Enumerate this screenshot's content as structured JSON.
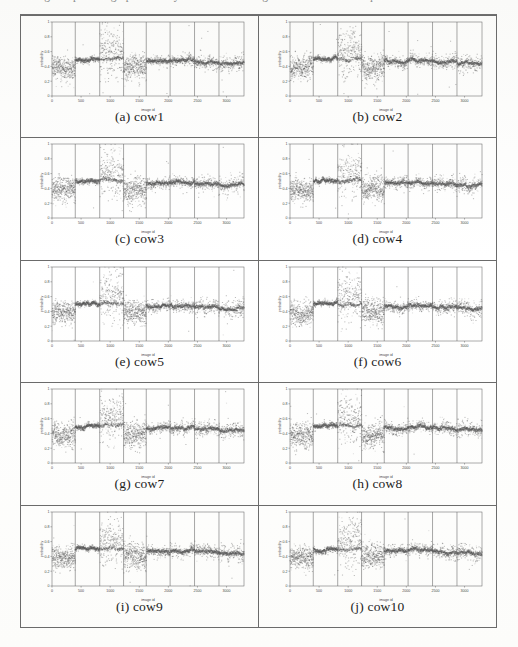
{
  "document": {
    "top_cut_text": "Figure: per-image probability scatter over image id for each cow sequence"
  },
  "figure": {
    "columns": 2,
    "rows": 5,
    "panels": [
      {
        "caption": "(a) cow1",
        "id": "cow1",
        "seed": 11
      },
      {
        "caption": "(b) cow2",
        "id": "cow2",
        "seed": 22
      },
      {
        "caption": "(c) cow3",
        "id": "cow3",
        "seed": 33
      },
      {
        "caption": "(d) cow4",
        "id": "cow4",
        "seed": 44
      },
      {
        "caption": "(e) cow5",
        "id": "cow5",
        "seed": 55
      },
      {
        "caption": "(f) cow6",
        "id": "cow6",
        "seed": 66
      },
      {
        "caption": "(g) cow7",
        "id": "cow7",
        "seed": 77
      },
      {
        "caption": "(h) cow8",
        "id": "cow8",
        "seed": 88
      },
      {
        "caption": "(i) cow9",
        "id": "cow9",
        "seed": 99
      },
      {
        "caption": "(j) cow10",
        "id": "cow10",
        "seed": 110
      }
    ]
  },
  "chart_data": {
    "type": "scatter",
    "title": "",
    "xlabel": "image id",
    "ylabel": "probability",
    "xlim": [
      0,
      3300
    ],
    "ylim": [
      0,
      1
    ],
    "xticks": [
      0,
      500,
      1000,
      1500,
      2000,
      2500,
      3000
    ],
    "xticklabels": [
      "0",
      "500",
      "1000",
      "1500",
      "2000",
      "2500",
      "3000"
    ],
    "yticks": [
      0,
      0.2,
      0.4,
      0.6,
      0.8,
      1
    ],
    "yticklabels": [
      "0",
      "0.2",
      "0.4",
      "0.6",
      "0.8",
      "1"
    ],
    "grid": false,
    "legend": null,
    "marker_color": "#555555",
    "segment_boundaries": [
      400,
      820,
      1230,
      1620,
      2030,
      2450,
      2870
    ],
    "segments": [
      {
        "range": [
          0,
          400
        ],
        "mean": 0.385,
        "spread": 0.075,
        "dense": false,
        "note": "noisy low band"
      },
      {
        "range": [
          400,
          820
        ],
        "mean": 0.5,
        "spread": 0.02,
        "dense": true,
        "note": "tight high band"
      },
      {
        "range": [
          820,
          1230
        ],
        "mean": 0.5,
        "spread": 0.15,
        "dense": true,
        "note": "tight band plus wide upward outlier cloud to 1.0"
      },
      {
        "range": [
          1230,
          1620
        ],
        "mean": 0.39,
        "spread": 0.085,
        "dense": false,
        "note": "noisy low band"
      },
      {
        "range": [
          1620,
          2030
        ],
        "mean": 0.475,
        "spread": 0.04,
        "dense": true,
        "note": "band"
      },
      {
        "range": [
          2030,
          2450
        ],
        "mean": 0.48,
        "spread": 0.04,
        "dense": true,
        "note": "band"
      },
      {
        "range": [
          2450,
          2870
        ],
        "mean": 0.46,
        "spread": 0.05,
        "dense": true,
        "note": "band"
      },
      {
        "range": [
          2870,
          3300
        ],
        "mean": 0.44,
        "spread": 0.06,
        "dense": true,
        "note": "band with downward drift"
      }
    ],
    "n_points_per_panel": 3300
  }
}
